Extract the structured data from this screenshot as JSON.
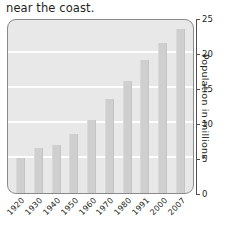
{
  "caption": {
    "clipped_line": "",
    "text": "near the coast."
  },
  "chart_data": {
    "type": "bar",
    "title": "",
    "xlabel": "",
    "ylabel": "Population in millions",
    "categories": [
      "1920",
      "1930",
      "1940",
      "1950",
      "1960",
      "1970",
      "1980",
      "1991",
      "2000",
      "2007"
    ],
    "values": [
      5.0,
      6.4,
      6.8,
      8.5,
      10.4,
      13.4,
      16.0,
      19.0,
      21.5,
      23.5
    ],
    "ylim": [
      0,
      25
    ],
    "yticks": [
      0,
      5,
      10,
      15,
      20,
      25
    ],
    "ytick_labels": [
      "0",
      "5",
      "10",
      "15",
      "20",
      "25"
    ],
    "grid": true,
    "legend": "none",
    "bar_color": "#cfcfcf",
    "panel_color": "#e8e8e8",
    "gridline_color": "#fdfdfd",
    "axis_color": "#4d4d4d"
  }
}
